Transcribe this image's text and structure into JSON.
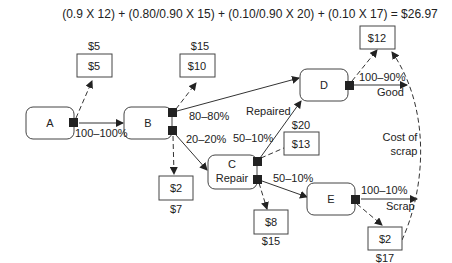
{
  "formula": "(0.9 X 12) + (0.80/0.90 X 15) + (0.10/0.90 X 20) + (0.10 X 17) = $26.97",
  "nodes": {
    "A": {
      "label": "A"
    },
    "B": {
      "label": "B"
    },
    "C": {
      "label": "C",
      "sublabel": "Repair"
    },
    "D": {
      "label": "D"
    },
    "E": {
      "label": "E"
    }
  },
  "cost_boxes": {
    "a_cost": {
      "value": "$5",
      "cumulative": "$5"
    },
    "b_cost": {
      "value": "$10",
      "cumulative": "$15"
    },
    "b_scrap": {
      "value": "$2",
      "cumulative": "$7"
    },
    "c_repair_cost": {
      "value": "$13",
      "cumulative": "$20"
    },
    "c_scrap_cost": {
      "value": "$8",
      "cumulative": "$15"
    },
    "d_cost": {
      "value": "$12"
    },
    "e_scrap": {
      "value": "$2",
      "cumulative": "$17"
    }
  },
  "edges": {
    "a_to_b": "100–100%",
    "b_to_d": "80–80%",
    "b_to_c": "20–20%",
    "c_to_d": "50–10%",
    "c_to_d_note": "Repaired",
    "c_to_e": "50–10%",
    "d_out": "100–90%",
    "d_out_note": "Good",
    "e_out": "100–10%",
    "e_out_note": "Scrap",
    "scrap_return_note_1": "Cost of",
    "scrap_return_note_2": "scrap"
  }
}
